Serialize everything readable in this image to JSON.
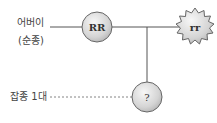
{
  "diagram": {
    "labels": {
      "parent": "어버이",
      "parent_sub": "(순종)",
      "f1": "잡종 1대"
    },
    "nodes": {
      "parent_a": {
        "genotype": "RR",
        "shape": "circle"
      },
      "parent_b": {
        "genotype": "rr",
        "shape": "starburst"
      },
      "offspring": {
        "genotype": "?",
        "shape": "circle"
      }
    },
    "colors": {
      "line": "#555555",
      "node_fill_light": "#f4f4f4",
      "node_fill_dark": "#bdbdbd",
      "node_stroke": "#666666",
      "text": "#444444"
    }
  }
}
